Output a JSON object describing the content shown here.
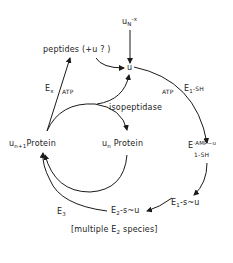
{
  "diagram": {
    "nodes": {
      "free_ubiquitin_source": {
        "base": "u",
        "sub": "N",
        "sup": "-x"
      },
      "peptides": "peptides (+u ? )",
      "ubiquitin": "u",
      "un_protein": {
        "base": "u",
        "sub": "n",
        "rest": "Protein"
      },
      "un1_protein": {
        "base": "u",
        "sub": "n+1",
        "rest": "Protein"
      },
      "e1_amp_u": {
        "base": "E",
        "sup": "·AMP~u",
        "sub": "1",
        "line2": "-SH"
      },
      "e1_s_u": {
        "base": "E",
        "sub": "1",
        "rest": "-s~u"
      },
      "e2_s_u": {
        "base": "E",
        "sub": "2",
        "rest": "-s~u"
      },
      "footnote": {
        "open": "[multiple E",
        "sub": "2",
        "close": " species]"
      }
    },
    "edge_labels": {
      "ex": {
        "base": "E",
        "sub": "x"
      },
      "ex_atp": "ATP",
      "atp": "ATP",
      "e1_sh": {
        "base": "E",
        "sub": "1",
        "rest": "-SH"
      },
      "isopeptidase": "isopeptidase",
      "e3": {
        "base": "E",
        "sub": "3"
      }
    },
    "stroke_color": "#1a1a1a"
  }
}
